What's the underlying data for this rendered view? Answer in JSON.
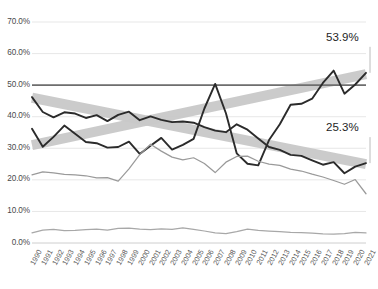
{
  "chart_data": {
    "type": "line",
    "title": "",
    "xlabel": "",
    "ylabel": "",
    "ylim": [
      0,
      70
    ],
    "ytick_labels": [
      "70.0%",
      "60.0%",
      "50.0%",
      "40.0%",
      "30.0%",
      "20.0%",
      "10.0%",
      "0.0%"
    ],
    "ytick_values": [
      70,
      60,
      50,
      40,
      30,
      20,
      10,
      0
    ],
    "grid": true,
    "legend_position": "none",
    "categories": [
      "1990",
      "1991",
      "1992",
      "1993",
      "1994",
      "1995",
      "1996",
      "1997",
      "1998",
      "1999",
      "2000",
      "2001",
      "2002",
      "2003",
      "2004",
      "2005",
      "2006",
      "2007",
      "2008",
      "2009",
      "2010",
      "2011",
      "2012",
      "2013",
      "2014",
      "2015",
      "2016",
      "2017",
      "2018",
      "2019",
      "2020",
      "2021"
    ],
    "reference_line": {
      "value": 50,
      "label": "50.0%",
      "color": "#6e6e6e"
    },
    "series": [
      {
        "name": "series-rising",
        "color": "#2b2b2b",
        "values": [
          36.2,
          30.5,
          33.6,
          37.2,
          34.6,
          32.0,
          31.6,
          30.2,
          30.4,
          32.1,
          28.2,
          30.8,
          33.3,
          29.6,
          31.1,
          33.0,
          42.6,
          50.4,
          41.1,
          28.4,
          25.1,
          24.6,
          32.6,
          37.6,
          43.8,
          44.1,
          45.7,
          50.7,
          54.6,
          47.3,
          50.2,
          53.9
        ]
      },
      {
        "name": "series-falling",
        "color": "#2b2b2b",
        "values": [
          46.2,
          41.5,
          39.8,
          41.4,
          41.0,
          39.6,
          40.5,
          38.6,
          40.6,
          41.6,
          38.9,
          40.1,
          39.0,
          38.3,
          38.5,
          38.1,
          36.7,
          35.6,
          35.1,
          37.6,
          35.9,
          33.1,
          30.4,
          29.5,
          27.9,
          27.6,
          26.2,
          24.8,
          25.6,
          22.1,
          24.2,
          25.3
        ]
      },
      {
        "name": "series-secondary",
        "color": "#9a9a9a",
        "values": [
          21.6,
          22.5,
          22.2,
          21.7,
          21.6,
          21.3,
          20.6,
          20.7,
          19.6,
          23.5,
          28.0,
          31.3,
          29.1,
          27.2,
          26.3,
          27.0,
          25.2,
          22.3,
          25.6,
          27.4,
          27.5,
          25.9,
          25.0,
          24.6,
          23.4,
          22.8,
          21.8,
          20.9,
          19.8,
          18.6,
          20.1,
          15.6
        ]
      },
      {
        "name": "series-baseline",
        "color": "#a8a8a8",
        "values": [
          3.2,
          4.1,
          4.3,
          3.9,
          4.0,
          4.2,
          4.4,
          4.1,
          4.6,
          4.7,
          4.4,
          4.2,
          4.5,
          4.3,
          4.8,
          4.3,
          3.8,
          3.2,
          3.0,
          3.6,
          4.4,
          4.0,
          3.8,
          3.6,
          3.4,
          3.3,
          3.1,
          2.9,
          2.8,
          3.0,
          3.4,
          3.2
        ]
      }
    ],
    "trend_bands": [
      {
        "name": "trend-band-up",
        "from": {
          "x": 0,
          "y": 31.0
        },
        "to": {
          "x": 31,
          "y": 53.5
        },
        "color": "#c9c9c9",
        "width": 10
      },
      {
        "name": "trend-band-down",
        "from": {
          "x": 0,
          "y": 46.0
        },
        "to": {
          "x": 31,
          "y": 25.0
        },
        "color": "#c9c9c9",
        "width": 10
      }
    ],
    "annotations": [
      {
        "name": "callout-top",
        "text": "53.9%",
        "value": 53.9,
        "x": 31
      },
      {
        "name": "callout-bottom",
        "text": "25.3%",
        "value": 25.3,
        "x": 31
      }
    ]
  },
  "footer": {
    "caption": ""
  }
}
